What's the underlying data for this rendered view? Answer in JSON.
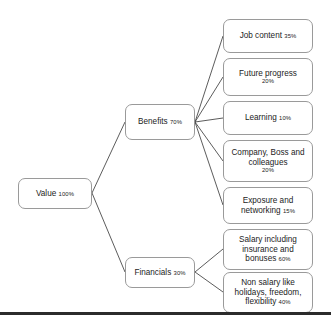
{
  "diagram": {
    "type": "tree",
    "title": "",
    "root": {
      "id": "value",
      "label": "Value",
      "pct": "100%"
    },
    "branches": [
      {
        "id": "benefits",
        "label": "Benefits",
        "pct": "70%",
        "children": [
          {
            "id": "job",
            "label": "Job content",
            "pct": "35%",
            "pct_own_line": false
          },
          {
            "id": "future",
            "label": "Future progress",
            "pct": "20%",
            "pct_own_line": true
          },
          {
            "id": "learning",
            "label": "Learning",
            "pct": "10%",
            "pct_own_line": false
          },
          {
            "id": "company",
            "label": "Company, Boss and colleagues",
            "pct": "20%",
            "pct_own_line": true
          },
          {
            "id": "exposure",
            "label": "Exposure and networking",
            "pct": "15%",
            "pct_own_line": false
          }
        ]
      },
      {
        "id": "financials",
        "label": "Financials",
        "pct": "30%",
        "children": [
          {
            "id": "salary",
            "label": "Salary including insurance and bonuses",
            "pct": "60%",
            "pct_own_line": false
          },
          {
            "id": "nonsalary",
            "label": "Non salary like holidays, freedom, flexibility",
            "pct": "40%",
            "pct_own_line": false
          }
        ]
      }
    ]
  },
  "style": {
    "box_border_color": "#9a9a9a",
    "box_fill_color": "#ffffff",
    "connector_color": "#4a4a4a",
    "rule_color": "#2b2b2b",
    "text_color": "#1c1c1c"
  }
}
